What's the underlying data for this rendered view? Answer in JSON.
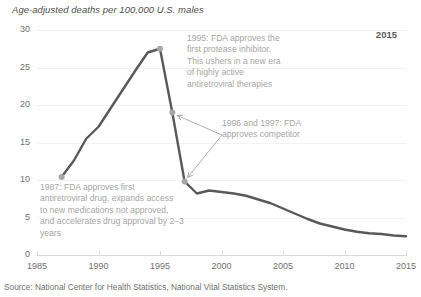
{
  "chart_data": {
    "type": "line",
    "title": "Age-adjusted deaths per 100,000 U.S. males",
    "xlabel": "",
    "ylabel": "Age-adjusted deaths per 100,000 U.S. males",
    "xlim": [
      1985,
      2015
    ],
    "ylim": [
      0,
      30
    ],
    "xticks": [
      1985,
      1990,
      1995,
      2000,
      2005,
      2010,
      2015
    ],
    "yticks": [
      0,
      5,
      10,
      15,
      20,
      25,
      30
    ],
    "grid": "horizontal",
    "legend": "none",
    "line_color": "#595959",
    "marker_color": "#a6a6a6",
    "annotation_color": "#a6a6a6",
    "x": [
      1987,
      1988,
      1989,
      1990,
      1991,
      1992,
      1993,
      1994,
      1995,
      1996,
      1997,
      1998,
      1999,
      2000,
      2001,
      2002,
      2003,
      2004,
      2005,
      2006,
      2007,
      2008,
      2009,
      2010,
      2011,
      2012,
      2013,
      2014,
      2015
    ],
    "values": [
      10.4,
      12.6,
      15.5,
      17.1,
      19.6,
      22.1,
      24.6,
      27.0,
      27.5,
      19.0,
      9.8,
      8.2,
      8.6,
      8.4,
      8.2,
      7.9,
      7.4,
      6.9,
      6.2,
      5.5,
      4.8,
      4.2,
      3.8,
      3.4,
      3.1,
      2.9,
      2.8,
      2.6,
      2.5
    ],
    "markers": [
      {
        "x": 1987,
        "y": 10.4
      },
      {
        "x": 1995,
        "y": 27.5
      },
      {
        "x": 1996,
        "y": 19.0
      },
      {
        "x": 1997,
        "y": 9.8
      }
    ],
    "annotations": [
      {
        "id": "a1995",
        "text": "1995: FDA approves the\nfirst protease inhibitor.\nThis ushers in a new era\nof highly active\nantiretroviral therapies"
      },
      {
        "id": "acompetitor",
        "text": "1996 and 1997: FDA\napproves competitor"
      },
      {
        "id": "a1987",
        "text": "1987: FDA approves first\nantiretroviral drug, expands access\nto new medications not approved,\nand accelerates drug approval by 2–3\nyears"
      },
      {
        "id": "badge",
        "text": "2015"
      }
    ],
    "source": "Source: National Center for Health Statistics, National Vital Statistics System."
  },
  "chart": {
    "axis_title": "Age-adjusted deaths per 100,000 U.S. males",
    "source": "Source: National Center for Health Statistics, National Vital Statistics System.",
    "year_badge": "2015",
    "yticks": [
      "30",
      "25",
      "20",
      "15",
      "10",
      "5",
      "0"
    ],
    "xticks": [
      "1985",
      "1990",
      "1995",
      "2000",
      "2005",
      "2010",
      "2015"
    ],
    "annotation_1995": "1995: FDA approves the\nfirst protease inhibitor.\nThis ushers in a new era\nof highly active\nantiretroviral therapies",
    "annotation_competitor": "1996 and 1997: FDA\napproves competitor",
    "annotation_1987": "1987: FDA approves first\nantiretroviral drug, expands access\nto new medications not approved,\nand accelerates drug approval by 2–3\nyears"
  }
}
